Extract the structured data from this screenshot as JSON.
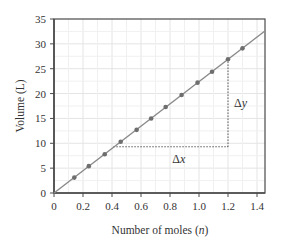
{
  "chart_data": {
    "type": "line",
    "title": "",
    "xlabel": "Number of moles (",
    "xlabel_var": "n",
    "xlabel_end": ")",
    "ylabel": "Volume (L)",
    "xlim": [
      0,
      1.45
    ],
    "ylim": [
      0,
      35
    ],
    "xticks": [
      0,
      0.2,
      0.4,
      0.6,
      0.8,
      1.0,
      1.2,
      1.4
    ],
    "xtick_labels": [
      "0",
      "0.2",
      "0.4",
      "0.6",
      "0.8",
      "1.0",
      "1.2",
      "1.4"
    ],
    "yticks": [
      0,
      5,
      10,
      15,
      20,
      25,
      30,
      35
    ],
    "ytick_labels": [
      "0",
      "5",
      "10",
      "15",
      "20",
      "25",
      "30",
      "35"
    ],
    "grid": true,
    "x_minor_grid": [
      0.1,
      0.3,
      0.5,
      0.7,
      0.9,
      1.1,
      1.3
    ],
    "line": {
      "slope": 22.4,
      "intercept": 0,
      "x_range": [
        0,
        1.45
      ]
    },
    "series": [
      {
        "name": "data",
        "x": [
          0.14,
          0.24,
          0.35,
          0.46,
          0.57,
          0.67,
          0.77,
          0.88,
          0.99,
          1.09,
          1.2,
          1.3
        ],
        "y": [
          3.1,
          5.4,
          7.8,
          10.3,
          12.7,
          15.0,
          17.3,
          19.7,
          22.2,
          24.4,
          26.9,
          29.1
        ]
      }
    ],
    "annotations": {
      "delta_x": {
        "label": "Δx",
        "from": [
          0.41,
          9.3
        ],
        "to": [
          1.2,
          9.3
        ]
      },
      "delta_y": {
        "label": "Δy",
        "from": [
          1.2,
          9.3
        ],
        "to": [
          1.2,
          26.9
        ]
      }
    },
    "colors": {
      "line": "#8a8a8a",
      "points": "#6e6e6e",
      "grid": "#e4e4e4",
      "axis": "#4a4a4a",
      "dotted": "#333333"
    }
  }
}
